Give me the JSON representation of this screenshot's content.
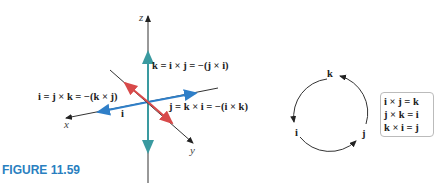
{
  "figure_label": "FIGURE 11.59",
  "axes": {
    "x": "x",
    "y": "y",
    "z": "z"
  },
  "equations": {
    "k_eq": "k = i × j = −(j × i)",
    "i_eq": "i = j × k = −(k × j)",
    "j_eq": "j = k × i = −(i × k)",
    "i_vec": "i"
  },
  "cycle": {
    "top": "k",
    "left": "i",
    "right": "j"
  },
  "box_lines": [
    "i × j = k",
    "j × k = i",
    "k × i = j"
  ],
  "colors": {
    "k_vector": "#3a9aa0",
    "i_vector": "#2f7fc8",
    "j_vector": "#d84a4a",
    "figure_label": "#2a7fc0"
  }
}
